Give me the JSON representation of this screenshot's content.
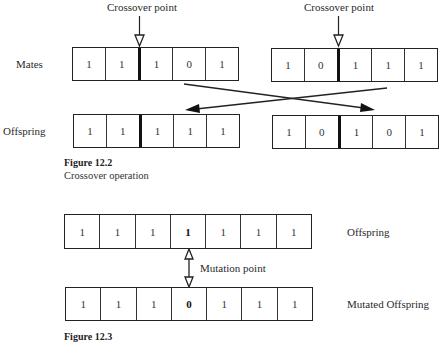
{
  "figure_12_2": {
    "title": "Figure 12.2",
    "caption": "Crossover operation",
    "row_labels": {
      "mates": "Mates",
      "offspring": "Offspring"
    },
    "crossover_label": "Crossover point",
    "mates": [
      {
        "genes": [
          "1",
          "1",
          "1",
          "0",
          "1"
        ],
        "crossover_after_index": 1
      },
      {
        "genes": [
          "1",
          "0",
          "1",
          "1",
          "1"
        ],
        "crossover_after_index": 1
      }
    ],
    "offspring": [
      {
        "genes": [
          "1",
          "1",
          "1",
          "1",
          "1"
        ],
        "crossover_after_index": 1
      },
      {
        "genes": [
          "1",
          "0",
          "1",
          "0",
          "1"
        ],
        "crossover_after_index": 1
      }
    ]
  },
  "figure_12_3": {
    "title": "Figure 12.3",
    "mutation_label": "Mutation point",
    "offspring_label": "Offspring",
    "mutated_label": "Mutated Offspring",
    "offspring": {
      "genes": [
        "1",
        "1",
        "1",
        "1",
        "1",
        "1",
        "1"
      ],
      "mutation_index": 3
    },
    "mutated": {
      "genes": [
        "1",
        "1",
        "1",
        "0",
        "1",
        "1",
        "1"
      ],
      "mutation_index": 3
    }
  }
}
